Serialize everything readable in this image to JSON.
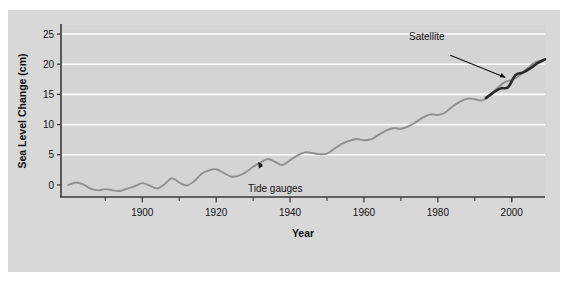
{
  "figure": {
    "background_color": "#d8d8d8",
    "plot_background_color": "#d4d4d4",
    "gridline_color": "#ffffff",
    "axis_color": "#3a3a3a",
    "page_background_color": "#ffffff"
  },
  "chart_data": {
    "type": "line",
    "title": "",
    "xlabel": "Year",
    "ylabel": "Sea Level Change (cm)",
    "xlim": [
      1878,
      2009
    ],
    "ylim": [
      -2,
      26.5
    ],
    "grid": true,
    "grid_axis": "y",
    "legend_position": "none",
    "xticks_major": [
      1900,
      1920,
      1940,
      1960,
      1980,
      2000
    ],
    "xticks_major_labels": [
      "1900",
      "1920",
      "1940",
      "1960",
      "1980",
      "2000"
    ],
    "xticks_minor": [
      1890,
      1910,
      1930,
      1950,
      1970,
      1990,
      2000
    ],
    "yticks": [
      0,
      5,
      10,
      15,
      20,
      25
    ],
    "ytick_labels": [
      "0",
      "5",
      "10",
      "15",
      "20",
      "25"
    ],
    "series": [
      {
        "name": "Tide gauges",
        "color": "#8f8f8f",
        "width": 1.9,
        "x": [
          1880,
          1882,
          1884,
          1886,
          1888,
          1890,
          1892,
          1894,
          1896,
          1898,
          1900,
          1902,
          1904,
          1906,
          1908,
          1910,
          1912,
          1914,
          1916,
          1918,
          1920,
          1922,
          1924,
          1926,
          1928,
          1930,
          1932,
          1934,
          1936,
          1938,
          1940,
          1942,
          1944,
          1946,
          1948,
          1950,
          1952,
          1954,
          1956,
          1958,
          1960,
          1962,
          1964,
          1966,
          1968,
          1970,
          1972,
          1974,
          1976,
          1978,
          1980,
          1982,
          1984,
          1986,
          1988,
          1990,
          1992,
          1994,
          1996,
          1998,
          2000,
          2002,
          2004,
          2006,
          2008
        ],
        "values": [
          0.0,
          0.4,
          0.1,
          -0.6,
          -0.9,
          -0.7,
          -0.9,
          -1.0,
          -0.6,
          -0.2,
          0.3,
          -0.1,
          -0.6,
          0.1,
          1.1,
          0.4,
          -0.1,
          0.6,
          1.8,
          2.4,
          2.6,
          2.0,
          1.4,
          1.5,
          2.1,
          3.0,
          3.7,
          4.3,
          3.8,
          3.3,
          4.1,
          4.9,
          5.4,
          5.3,
          5.1,
          5.2,
          6.0,
          6.8,
          7.3,
          7.6,
          7.4,
          7.6,
          8.3,
          9.0,
          9.4,
          9.3,
          9.7,
          10.4,
          11.2,
          11.7,
          11.6,
          12.0,
          13.0,
          13.8,
          14.3,
          14.2,
          14.0,
          14.8,
          16.0,
          17.0,
          17.4,
          18.1,
          19.2,
          20.2,
          20.6
        ]
      },
      {
        "name": "Satellite",
        "color": "#2a2a2a",
        "width": 2.6,
        "x": [
          1993,
          1995,
          1997,
          1999,
          2001,
          2003,
          2005,
          2007,
          2009
        ],
        "values": [
          14.4,
          15.3,
          16.0,
          16.2,
          18.2,
          18.6,
          19.3,
          20.2,
          20.8
        ]
      }
    ],
    "annotations": [
      {
        "text": "Tide gauges",
        "label_x": 1936,
        "label_y": -1.2,
        "point_x": 1931,
        "point_y": 4.1
      },
      {
        "text": "Satellite",
        "label_x": 1977,
        "label_y": 24.0,
        "point_x": 1999,
        "point_y": 17.6
      }
    ]
  }
}
